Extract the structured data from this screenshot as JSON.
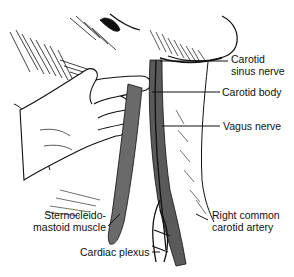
{
  "diagram": {
    "type": "anatomical-illustration",
    "labels": {
      "carotid_sinus_nerve_line1": "Carotid",
      "carotid_sinus_nerve_line2": "sinus nerve",
      "carotid_body": "Carotid body",
      "vagus_nerve": "Vagus nerve",
      "sternocleidomastoid_line1": "Sternocleido-",
      "sternocleidomastoid_line2": "mastoid muscle",
      "cardiac_plexus": "Cardiac plexus",
      "right_common_carotid_line1": "Right common",
      "right_common_carotid_line2": "carotid artery"
    },
    "colors": {
      "ink": "#111111",
      "artery_fill": "#5a5a5a",
      "muscle_fill": "#6a6a6a",
      "background": "#ffffff"
    }
  }
}
